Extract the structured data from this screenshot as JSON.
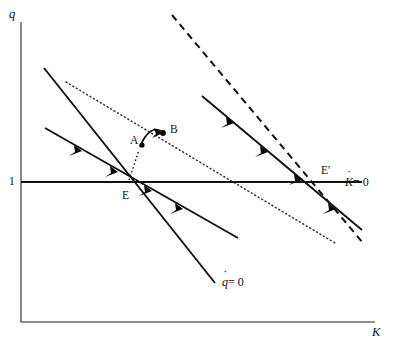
{
  "figure": {
    "type": "phase-diagram",
    "axes": {
      "y_label": "q",
      "x_label": "K",
      "y_tick_label": "1",
      "y_tick_value": 1,
      "origin_px": [
        21,
        322
      ],
      "x_axis_end_px": [
        375,
        322
      ],
      "y_axis_top_px": [
        21,
        22
      ]
    },
    "labels": {
      "point_E": "E",
      "point_E_prime": "E'",
      "point_A": "A",
      "point_B": "B",
      "kdot_zero": "K",
      "kdot_zero_eq": "= 0",
      "qdot_zero": "q",
      "qdot_zero_eq": "= 0"
    },
    "loci": [
      {
        "name": "kdot-zero-locus",
        "style": "solid-horizontal",
        "description": "K-dot = 0 horizontal line at q = 1",
        "points": [
          [
            21,
            182
          ],
          [
            362,
            182
          ]
        ]
      },
      {
        "name": "qdot-zero-locus-original",
        "style": "solid",
        "description": "original q-dot = 0 downward sloping line through E",
        "points": [
          [
            44,
            68
          ],
          [
            215,
            283
          ]
        ]
      },
      {
        "name": "qdot-zero-locus-new",
        "style": "dashed",
        "description": "new q-dot = 0 downward sloping line through E-prime",
        "points": [
          [
            172,
            15
          ],
          [
            363,
            243
          ]
        ]
      },
      {
        "name": "saddle-path-original",
        "style": "solid-arrows",
        "description": "original stable saddle path through E",
        "points": [
          [
            45,
            128
          ],
          [
            238,
            238
          ]
        ]
      },
      {
        "name": "saddle-path-new",
        "style": "solid-arrows",
        "description": "new stable saddle path through E-prime",
        "points": [
          [
            202,
            96
          ],
          [
            362,
            230
          ]
        ]
      },
      {
        "name": "dotted-reference-line",
        "style": "dotted",
        "description": "dotted auxiliary line from upper left through B to lower right",
        "points": [
          [
            66,
            82
          ],
          [
            335,
            243
          ]
        ]
      }
    ],
    "points": [
      {
        "name": "E",
        "label": "E",
        "px": [
          127,
          182
        ]
      },
      {
        "name": "E'",
        "label": "E'",
        "px": [
          325,
          182
        ]
      },
      {
        "name": "A",
        "label": "A",
        "px": [
          142,
          145
        ]
      },
      {
        "name": "B",
        "label": "B",
        "px": [
          163,
          133
        ]
      }
    ],
    "trajectory": {
      "name": "jump-path-E-to-B",
      "description": "curved arrow from E through A up to B",
      "has_arrowhead": true
    },
    "colors": {
      "ink": "#111111",
      "axis": "#6b6b6b",
      "background": "#ffffff"
    }
  }
}
